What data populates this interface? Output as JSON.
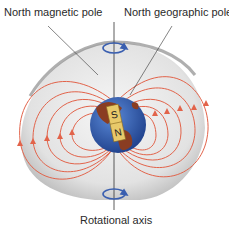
{
  "labels": {
    "north_magnetic_pole": "North magnetic pole",
    "north_geographic_pole": "North geographic pole",
    "rotational_axis": "Rotational axis"
  },
  "magnet": {
    "south": "S",
    "north": "N"
  },
  "colors": {
    "field_line": "#e2634a",
    "globe_ocean": "#2f5fb5",
    "land": "#8a3d22",
    "magnet_bar": "#e8c96a",
    "axis_arrow": "#3a5fb0",
    "shadow": "#d8d8d8"
  }
}
